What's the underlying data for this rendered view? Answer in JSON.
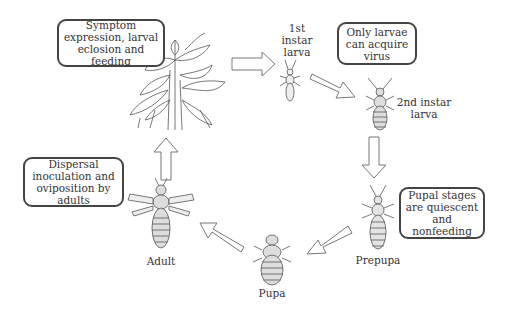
{
  "diagram": {
    "type": "life-cycle",
    "callouts": {
      "plant": "Symptom expression, larval eclosion and feeding",
      "acquire": "Only larvae can acquire virus",
      "pupal": "Pupal stages are quiescent and nonfeeding",
      "adult": "Dispersal inoculation and oviposition by adults"
    },
    "stages": {
      "first_instar": "1st instar larva",
      "second_instar": "2nd instar larva",
      "prepupa": "Prepupa",
      "pupa": "Pupa",
      "adult": "Adult"
    },
    "cycle_order": [
      "Plant",
      "1st instar larva",
      "2nd instar larva",
      "Prepupa",
      "Pupa",
      "Adult",
      "Plant"
    ]
  }
}
